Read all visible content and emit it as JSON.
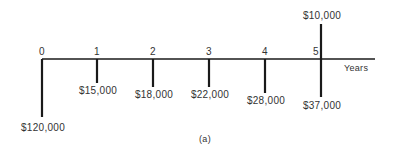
{
  "diagram": {
    "type": "cash-flow-diagram",
    "caption": "(a)",
    "axis_label": "Years",
    "axis": {
      "x_start": 42,
      "x_end": 375,
      "y": 59
    },
    "periods": [
      {
        "year": "0",
        "x": 42
      },
      {
        "year": "1",
        "x": 97
      },
      {
        "year": "2",
        "x": 153
      },
      {
        "year": "3",
        "x": 209
      },
      {
        "year": "4",
        "x": 265
      },
      {
        "year": "5",
        "x": 321
      }
    ],
    "cash_flows": [
      {
        "year": 0,
        "direction": "down",
        "amount": "$120,000",
        "value": -120000,
        "x": 42,
        "end_y": 117,
        "label_y": 123
      },
      {
        "year": 1,
        "direction": "down",
        "amount": "$15,000",
        "value": -15000,
        "x": 97,
        "end_y": 83,
        "label_y": 86
      },
      {
        "year": 2,
        "direction": "down",
        "amount": "$18,000",
        "value": -18000,
        "x": 153,
        "end_y": 87,
        "label_y": 90
      },
      {
        "year": 3,
        "direction": "down",
        "amount": "$22,000",
        "value": -22000,
        "x": 209,
        "end_y": 87,
        "label_y": 90
      },
      {
        "year": 4,
        "direction": "down",
        "amount": "$28,000",
        "value": -28000,
        "x": 265,
        "end_y": 93,
        "label_y": 96
      },
      {
        "year": 5,
        "direction": "down",
        "amount": "$37,000",
        "value": -37000,
        "x": 321,
        "end_y": 97,
        "label_y": 101
      },
      {
        "year": 5,
        "direction": "up",
        "amount": "$10,000",
        "value": 10000,
        "x": 321,
        "end_y": 24,
        "label_y": 11
      }
    ],
    "colors": {
      "line": "#1a1a1a",
      "text": "#333333",
      "background": "#ffffff"
    }
  }
}
